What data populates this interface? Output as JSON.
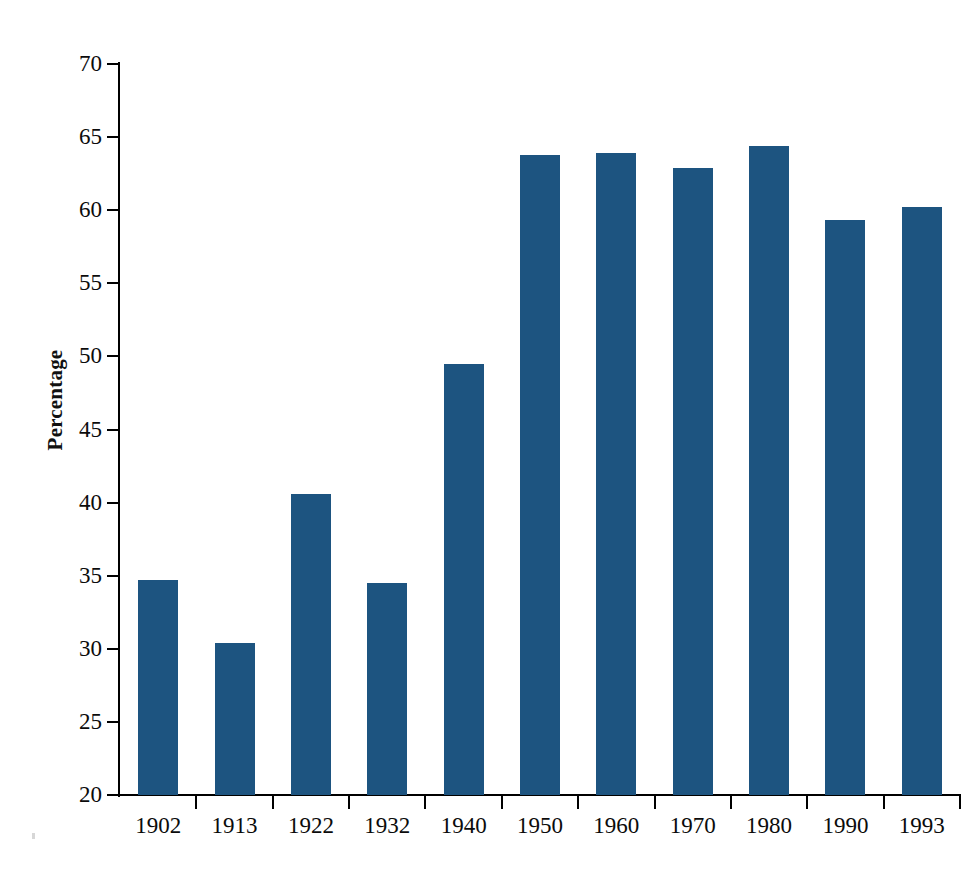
{
  "chart_data": {
    "type": "bar",
    "title": "",
    "subtitle": "",
    "xlabel": "",
    "ylabel": "Percentage",
    "categories": [
      "1902",
      "1913",
      "1922",
      "1932",
      "1940",
      "1950",
      "1960",
      "1970",
      "1980",
      "1990",
      "1993"
    ],
    "values": [
      34.7,
      30.4,
      40.6,
      34.5,
      49.5,
      63.8,
      63.9,
      62.9,
      64.4,
      59.3,
      60.2
    ],
    "ylim": [
      20,
      70
    ],
    "yticks": [
      20,
      25,
      30,
      35,
      40,
      45,
      50,
      55,
      60,
      65,
      70
    ],
    "ytick_labels": [
      "20",
      "25",
      "30",
      "35",
      "40",
      "45",
      "50",
      "55",
      "60",
      "65",
      "70"
    ],
    "grid": false,
    "legend": null,
    "legend_position": "none",
    "bar_color": "#1d5480",
    "axis_color": "#000000",
    "background_color": "#ffffff",
    "series": [
      {
        "name": "Percentage",
        "values": [
          34.7,
          30.4,
          40.6,
          34.5,
          49.5,
          63.8,
          63.9,
          62.9,
          64.4,
          59.3,
          60.2
        ]
      }
    ]
  }
}
